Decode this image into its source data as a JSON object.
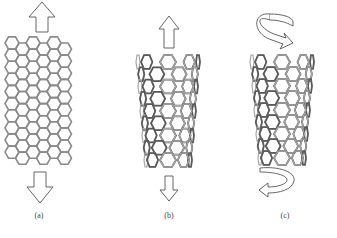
{
  "figure": {
    "panels": [
      {
        "id": "a",
        "label": "(a)",
        "structure": "graphene-sheet",
        "loading": "axial-tension",
        "arrows": [
          "arrow-up",
          "arrow-down"
        ]
      },
      {
        "id": "b",
        "label": "(b)",
        "structure": "carbon-nanotube",
        "loading": "axial-tension",
        "arrows": [
          "arrow-up",
          "arrow-down"
        ]
      },
      {
        "id": "c",
        "label": "(c)",
        "structure": "carbon-nanotube",
        "loading": "torsion",
        "arrows": [
          "curved-arrow-top",
          "curved-arrow-bottom"
        ]
      }
    ],
    "colors": {
      "lattice": "#8a8a8a",
      "lattice_dark": "#5a5a5a",
      "arrow_stroke": "#555555",
      "background": "#ffffff"
    }
  }
}
